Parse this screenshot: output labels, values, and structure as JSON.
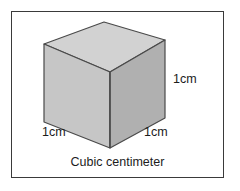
{
  "figure": {
    "caption": "Cubic centimeter",
    "frame_color": "#3a3a3a",
    "background_color": "#ffffff"
  },
  "cube": {
    "edge_color": "#4a4a4a",
    "faces": {
      "top": {
        "name": "top-face",
        "fill": "#d2d2d2"
      },
      "left": {
        "name": "left-face",
        "fill": "#c6c6c6"
      },
      "right": {
        "name": "right-face",
        "fill": "#b0b0b0"
      }
    }
  },
  "labels": {
    "right": "1cm",
    "bottom_left": "1cm",
    "bottom_right": "1cm"
  }
}
